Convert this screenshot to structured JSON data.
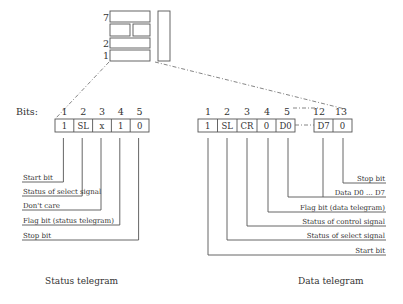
{
  "stack": {
    "row_labels": [
      "7",
      "2",
      "1"
    ]
  },
  "status_telegram": {
    "bits_prefix": "Bits:",
    "bit_numbers": [
      "1",
      "2",
      "3",
      "4",
      "5"
    ],
    "cells": [
      "1",
      "SL",
      "x",
      "1",
      "0"
    ],
    "labels": [
      "Start bit",
      "Status of select signal",
      "Don't care",
      "Flag bit (status telegram)",
      "Stop bit"
    ],
    "caption": "Status telegram"
  },
  "data_telegram": {
    "bit_numbers": [
      "1",
      "2",
      "3",
      "4",
      "5",
      "12",
      "13"
    ],
    "cells": [
      "1",
      "SL",
      "CR",
      "0",
      "D0",
      "D7",
      "0"
    ],
    "labels": [
      "Stop bit",
      "Data D0 ... D7",
      "Flag bit (data telegram)",
      "Status of control signal",
      "Status of select signal",
      "Start bit"
    ],
    "caption": "Data telegram"
  }
}
